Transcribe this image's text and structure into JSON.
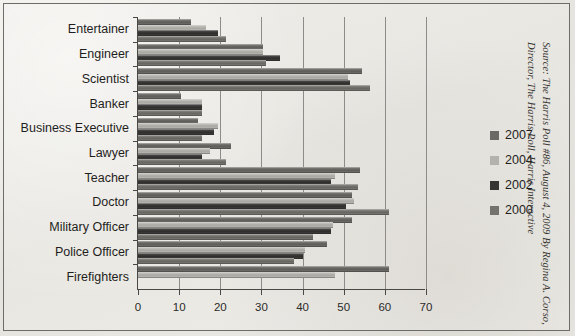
{
  "figure": {
    "source_note": "Source: The Harris Poll #86, August 4, 2009 By Regina A. Corso,\nDirector, The Harris Poll, Harris Interactive",
    "border_color": "#6e6c68",
    "paper_color": "#e8e6e1"
  },
  "legend": {
    "position": "right",
    "entries": [
      {
        "label": "2007",
        "color": "#6b6965"
      },
      {
        "label": "2004",
        "color": "#b4b2ad"
      },
      {
        "label": "2002",
        "color": "#363533"
      },
      {
        "label": "2000",
        "color": "#75736e"
      }
    ]
  },
  "chart_data": {
    "type": "bar",
    "orientation": "horizontal",
    "title": "",
    "xlabel": "",
    "ylabel": "",
    "xlim": [
      0,
      70
    ],
    "xticks": [
      0,
      10,
      20,
      30,
      40,
      50,
      60,
      70
    ],
    "xtick_labels": [
      "0",
      "10",
      "20",
      "30",
      "40",
      "50",
      "60",
      "70"
    ],
    "grid": "vertical",
    "categories": [
      "Entertainer",
      "Engineer",
      "Scientist",
      "Banker",
      "Business Executive",
      "Lawyer",
      "Teacher",
      "Doctor",
      "Military Officer",
      "Police Officer",
      "Firefighters"
    ],
    "series": [
      {
        "name": "2007",
        "color": "#6b6965",
        "values": [
          13,
          30.5,
          54.5,
          10.5,
          14.5,
          22.5,
          54,
          52,
          52,
          46,
          61
        ]
      },
      {
        "name": "2004",
        "color": "#b4b2ad",
        "values": [
          16.5,
          30.5,
          51,
          15.5,
          19.5,
          17.5,
          48,
          52.5,
          47.5,
          40.5,
          48
        ]
      },
      {
        "name": "2002",
        "color": "#363533",
        "values": [
          19.5,
          34.5,
          51.5,
          15.5,
          18.5,
          15.5,
          47,
          50.5,
          47,
          40,
          0
        ]
      },
      {
        "name": "2000",
        "color": "#75736e",
        "values": [
          21.5,
          31,
          56.5,
          15.5,
          15.5,
          21.5,
          53.5,
          61,
          42.5,
          38,
          0
        ]
      }
    ]
  }
}
